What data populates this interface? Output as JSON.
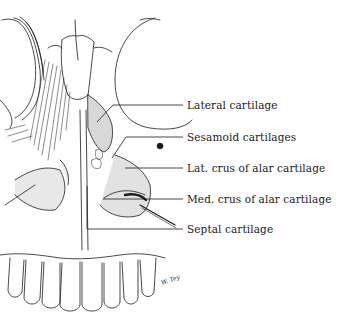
{
  "figure": {
    "style": "pen-and-ink anatomical line drawing",
    "signature": "W. Tey"
  },
  "labels": [
    {
      "id": "lateral-cartilage",
      "text": "Lateral cartilage",
      "y": 105
    },
    {
      "id": "sesamoid-cartilages",
      "text": "Sesamoid cartilages",
      "y": 137
    },
    {
      "id": "lat-crus",
      "text": "Lat. crus of alar cartilage",
      "y": 168
    },
    {
      "id": "med-crus",
      "text": "Med. crus of alar cartilage",
      "y": 199
    },
    {
      "id": "septal-cartilage",
      "text": "Septal cartilage",
      "y": 229
    }
  ],
  "colors": {
    "ink": "#1a1a1a",
    "background": "#ffffff",
    "shade": "#d8d8d8"
  }
}
